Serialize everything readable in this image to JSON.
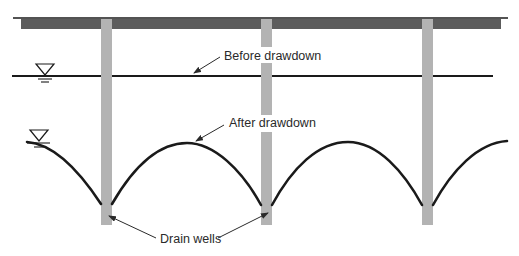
{
  "diagram": {
    "type": "drain-well drawdown cross-section",
    "labels": {
      "before": "Before drawdown",
      "after": "After drawdown",
      "wells": "Drain wells"
    },
    "colors": {
      "line": "#1a1a1a",
      "beam": "#5c5c5c",
      "well": "#b3b3b3",
      "text": "#2a2a2a"
    },
    "wells": [
      {
        "name": "well-1",
        "x": 101
      },
      {
        "name": "well-2",
        "x": 261
      },
      {
        "name": "well-3",
        "x": 422
      }
    ],
    "water_table_symbols": [
      {
        "name": "before-water-table-symbol"
      },
      {
        "name": "after-water-table-symbol"
      }
    ]
  }
}
